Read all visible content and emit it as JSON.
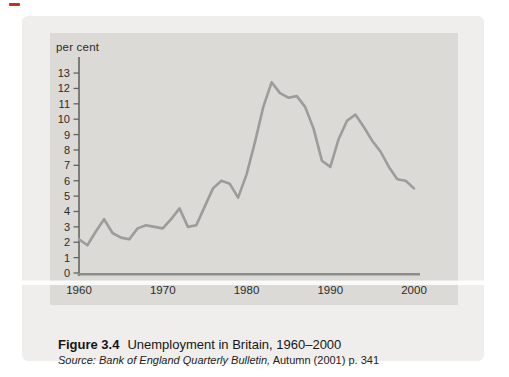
{
  "figure": {
    "axis_label": "per cent",
    "caption_label": "Figure 3.4",
    "caption_title": "Unemployment in Britain, 1960–2000",
    "source_italic": "Source: Bank of England Quarterly Bulletin,",
    "source_rest": " Autumn (2001) p. 341"
  },
  "colors": {
    "page": "#ffffff",
    "card": "#efeeec",
    "panel": "#dbdad7",
    "curve": "#9c9c9a",
    "baseline": "#8c8c8a",
    "axis": "#636361",
    "tick_text": "#2b2b29",
    "red_mark": "#c03026",
    "scan_stripe": "#ffffff"
  },
  "chart_data": {
    "type": "line",
    "title": "Unemployment in Britain, 1960–2000",
    "xlabel": "",
    "ylabel": "per cent",
    "x": [
      1960,
      1961,
      1962,
      1963,
      1964,
      1965,
      1966,
      1967,
      1968,
      1969,
      1970,
      1971,
      1972,
      1973,
      1974,
      1975,
      1976,
      1977,
      1978,
      1979,
      1980,
      1981,
      1982,
      1983,
      1984,
      1985,
      1986,
      1987,
      1988,
      1989,
      1990,
      1991,
      1992,
      1993,
      1994,
      1995,
      1996,
      1997,
      1998,
      1999,
      2000
    ],
    "values": [
      2.2,
      1.8,
      2.7,
      3.5,
      2.6,
      2.3,
      2.2,
      2.9,
      3.1,
      3.0,
      2.9,
      3.5,
      4.2,
      3.0,
      3.1,
      4.3,
      5.5,
      6.0,
      5.8,
      4.9,
      6.4,
      8.5,
      10.8,
      12.4,
      11.7,
      11.4,
      11.5,
      10.8,
      9.4,
      7.3,
      6.9,
      8.7,
      9.9,
      10.3,
      9.5,
      8.6,
      7.9,
      6.9,
      6.1,
      6.0,
      5.5
    ],
    "xticks": [
      1960,
      1970,
      1980,
      1990,
      2000
    ],
    "yticks": [
      0,
      1,
      2,
      3,
      4,
      5,
      6,
      7,
      8,
      9,
      10,
      11,
      12,
      13
    ],
    "xlim": [
      1960,
      2000
    ],
    "ylim": [
      0,
      14
    ],
    "grid": false,
    "legend": null
  }
}
